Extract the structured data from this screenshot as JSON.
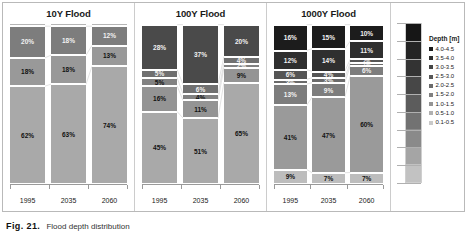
{
  "figure": {
    "caption_label": "Fig. 21.",
    "caption_text": "Flood depth distribution"
  },
  "legend": {
    "title": "Depth [m]",
    "items": [
      {
        "label": "4.0-4.5",
        "color": "#1a1a1a"
      },
      {
        "label": "3.5-4.0",
        "color": "#2e2e2e"
      },
      {
        "label": "3.0-3.5",
        "color": "#444444"
      },
      {
        "label": "2.5-3.0",
        "color": "#575757"
      },
      {
        "label": "2.0-2.5",
        "color": "#6b6b6b"
      },
      {
        "label": "1.5-2.0",
        "color": "#808080"
      },
      {
        "label": "1.0-1.5",
        "color": "#949494"
      },
      {
        "label": "0.5-1.0",
        "color": "#b0b0b0"
      },
      {
        "label": "0.1-0.5",
        "color": "#c9c9c9"
      }
    ],
    "gradient_stops": [
      "#161616",
      "#242424",
      "#333333",
      "#474747",
      "#5c5c5c",
      "#727272",
      "#8a8a8a",
      "#a5a5a5",
      "#c2c2c2"
    ]
  },
  "chart_data": [
    {
      "type": "bar",
      "title": "10Y Flood",
      "stacked": true,
      "xlabel": "",
      "ylabel": "",
      "ylim": [
        0,
        100
      ],
      "grid": false,
      "legend_position": "right-shared",
      "categories": [
        "1995",
        "2035",
        "2060"
      ],
      "series": [
        {
          "name": "4.0-4.5",
          "color": "#1a1a1a",
          "values": [
            0,
            0,
            0
          ]
        },
        {
          "name": "3.5-4.0",
          "color": "#2e2e2e",
          "values": [
            0,
            0,
            0
          ]
        },
        {
          "name": "3.0-3.5",
          "color": "#444444",
          "values": [
            0,
            0,
            0
          ]
        },
        {
          "name": "2.5-3.0",
          "color": "#575757",
          "values": [
            0,
            0,
            0
          ]
        },
        {
          "name": "2.0-2.5",
          "color": "#6b6b6b",
          "values": [
            0,
            0,
            0
          ]
        },
        {
          "name": "1.5-2.0",
          "color": "#808080",
          "values": [
            20,
            18,
            12
          ]
        },
        {
          "name": "1.0-1.5",
          "color": "#949494",
          "values": [
            18,
            18,
            13
          ]
        },
        {
          "name": "0.5-1.0",
          "color": "#b0b0b0",
          "values": [
            62,
            63,
            74
          ]
        },
        {
          "name": "0.1-0.5",
          "color": "#c9c9c9",
          "values": [
            0,
            1,
            1
          ]
        }
      ],
      "bars": [
        {
          "category": "1995",
          "segments": [
            {
              "label": "",
              "value": 2,
              "color": "#b5b5b5",
              "show_label": false
            },
            {
              "label": "20%",
              "value": 20,
              "color": "#7d7d7d",
              "show_label": true,
              "dark": true
            },
            {
              "label": "18%",
              "value": 18,
              "color": "#999999",
              "show_label": true,
              "dark": false
            },
            {
              "label": "62%",
              "value": 62,
              "color": "#a9a9a9",
              "show_label": true,
              "dark": false
            }
          ]
        },
        {
          "category": "2035",
          "segments": [
            {
              "label": "",
              "value": 2,
              "color": "#b5b5b5",
              "show_label": false
            },
            {
              "label": "18%",
              "value": 18,
              "color": "#7d7d7d",
              "show_label": true,
              "dark": true
            },
            {
              "label": "18%",
              "value": 18,
              "color": "#999999",
              "show_label": true,
              "dark": false
            },
            {
              "label": "63%",
              "value": 62,
              "color": "#a9a9a9",
              "show_label": true,
              "dark": false
            }
          ]
        },
        {
          "category": "2060",
          "segments": [
            {
              "label": "",
              "value": 2,
              "color": "#b5b5b5",
              "show_label": false
            },
            {
              "label": "12%",
              "value": 12,
              "color": "#7d7d7d",
              "show_label": true,
              "dark": true
            },
            {
              "label": "13%",
              "value": 13,
              "color": "#999999",
              "show_label": true,
              "dark": false
            },
            {
              "label": "74%",
              "value": 73,
              "color": "#a9a9a9",
              "show_label": true,
              "dark": false
            }
          ]
        }
      ]
    },
    {
      "type": "bar",
      "title": "100Y Flood",
      "stacked": true,
      "xlabel": "",
      "ylabel": "",
      "ylim": [
        0,
        100
      ],
      "grid": false,
      "legend_position": "right-shared",
      "categories": [
        "1995",
        "2035",
        "2060"
      ],
      "series": [
        {
          "name": "2.0-2.5",
          "color": "#4a4a4a",
          "values": [
            28,
            37,
            20
          ]
        },
        {
          "name": "1.5-2.0",
          "color": "#6e6e6e",
          "values": [
            5,
            6,
            4
          ]
        },
        {
          "name": "1.0-1.5",
          "color": "#808080",
          "values": [
            5,
            4,
            2
          ]
        },
        {
          "name": "0.5-1.0",
          "color": "#949494",
          "values": [
            16,
            11,
            9
          ]
        },
        {
          "name": "0.1-0.5",
          "color": "#a9a9a9",
          "values": [
            45,
            51,
            65
          ]
        }
      ],
      "bars": [
        {
          "category": "1995",
          "segments": [
            {
              "label": "",
              "value": 1,
              "color": "#3a3a3a",
              "show_label": false
            },
            {
              "label": "28%",
              "value": 28,
              "color": "#4a4a4a",
              "show_label": true,
              "dark": true
            },
            {
              "label": "5%",
              "value": 5,
              "color": "#707070",
              "show_label": true,
              "dark": true
            },
            {
              "label": "5%",
              "value": 5,
              "color": "#828282",
              "show_label": true,
              "dark": false
            },
            {
              "label": "16%",
              "value": 16,
              "color": "#949494",
              "show_label": true,
              "dark": false
            },
            {
              "label": "45%",
              "value": 45,
              "color": "#a9a9a9",
              "show_label": true,
              "dark": false
            }
          ]
        },
        {
          "category": "2035",
          "segments": [
            {
              "label": "",
              "value": 1,
              "color": "#3a3a3a",
              "show_label": false
            },
            {
              "label": "37%",
              "value": 37,
              "color": "#4a4a4a",
              "show_label": true,
              "dark": true
            },
            {
              "label": "6%",
              "value": 6,
              "color": "#707070",
              "show_label": true,
              "dark": true
            },
            {
              "label": "4%",
              "value": 4,
              "color": "#828282",
              "show_label": true,
              "dark": false
            },
            {
              "label": "11%",
              "value": 11,
              "color": "#949494",
              "show_label": true,
              "dark": false
            },
            {
              "label": "51%",
              "value": 41,
              "color": "#a9a9a9",
              "show_label": true,
              "dark": false
            }
          ]
        },
        {
          "category": "2060",
          "segments": [
            {
              "label": "",
              "value": 1,
              "color": "#3a3a3a",
              "show_label": false
            },
            {
              "label": "20%",
              "value": 20,
              "color": "#4a4a4a",
              "show_label": true,
              "dark": true
            },
            {
              "label": "4%",
              "value": 4,
              "color": "#707070",
              "show_label": true,
              "dark": true
            },
            {
              "label": "2%",
              "value": 3,
              "color": "#828282",
              "show_label": true,
              "dark": true
            },
            {
              "label": "9%",
              "value": 9,
              "color": "#949494",
              "show_label": true,
              "dark": false
            },
            {
              "label": "65%",
              "value": 63,
              "color": "#a9a9a9",
              "show_label": true,
              "dark": false
            }
          ]
        }
      ]
    },
    {
      "type": "bar",
      "title": "1000Y Flood",
      "stacked": true,
      "xlabel": "",
      "ylabel": "",
      "ylim": [
        0,
        100
      ],
      "grid": false,
      "legend_position": "right-shared",
      "categories": [
        "1995",
        "2035",
        "2060"
      ],
      "series": [
        {
          "name": "4.0-4.5",
          "color": "#1a1a1a",
          "values": [
            16,
            15,
            10
          ]
        },
        {
          "name": "3.5-4.0",
          "color": "#2e2e2e",
          "values": [
            12,
            14,
            11
          ]
        },
        {
          "name": "3.0-3.5",
          "color": "#555555",
          "values": [
            6,
            4,
            2
          ]
        },
        {
          "name": "2.5-3.0",
          "color": "#6b6b6b",
          "values": [
            3,
            3,
            1
          ]
        },
        {
          "name": "2.0-2.5",
          "color": "#7d7d7d",
          "values": [
            13,
            9,
            6
          ]
        },
        {
          "name": "1.5-2.0",
          "color": "#9a9a9a",
          "values": [
            41,
            47,
            60
          ]
        },
        {
          "name": "0.5-1.0",
          "color": "#bdbdbd",
          "values": [
            9,
            7,
            7
          ]
        }
      ],
      "bars": [
        {
          "category": "1995",
          "segments": [
            {
              "label": "",
              "value": 1,
              "color": "#0d0d0d",
              "show_label": false
            },
            {
              "label": "16%",
              "value": 16,
              "color": "#1c1c1c",
              "show_label": true,
              "dark": true
            },
            {
              "label": "12%",
              "value": 12,
              "color": "#2f2f2f",
              "show_label": true,
              "dark": true
            },
            {
              "label": "6%",
              "value": 6,
              "color": "#555555",
              "show_label": true,
              "dark": true
            },
            {
              "label": "3%",
              "value": 3,
              "color": "#6b6b6b",
              "show_label": true,
              "dark": true
            },
            {
              "label": "13%",
              "value": 13,
              "color": "#7d7d7d",
              "show_label": true,
              "dark": true
            },
            {
              "label": "41%",
              "value": 40,
              "color": "#9a9a9a",
              "show_label": true,
              "dark": false
            },
            {
              "label": "9%",
              "value": 9,
              "color": "#bdbdbd",
              "show_label": true,
              "dark": false
            }
          ]
        },
        {
          "category": "2035",
          "segments": [
            {
              "label": "",
              "value": 1,
              "color": "#0d0d0d",
              "show_label": false
            },
            {
              "label": "15%",
              "value": 15,
              "color": "#1c1c1c",
              "show_label": true,
              "dark": true
            },
            {
              "label": "14%",
              "value": 14,
              "color": "#2f2f2f",
              "show_label": true,
              "dark": true
            },
            {
              "label": "4%",
              "value": 4,
              "color": "#555555",
              "show_label": true,
              "dark": true
            },
            {
              "label": "3%",
              "value": 3,
              "color": "#6b6b6b",
              "show_label": true,
              "dark": true
            },
            {
              "label": "9%",
              "value": 9,
              "color": "#7d7d7d",
              "show_label": true,
              "dark": true
            },
            {
              "label": "47%",
              "value": 47,
              "color": "#9a9a9a",
              "show_label": true,
              "dark": false
            },
            {
              "label": "7%",
              "value": 7,
              "color": "#bdbdbd",
              "show_label": true,
              "dark": false
            }
          ]
        },
        {
          "category": "2060",
          "segments": [
            {
              "label": "",
              "value": 1,
              "color": "#0d0d0d",
              "show_label": false
            },
            {
              "label": "10%",
              "value": 10,
              "color": "#1c1c1c",
              "show_label": true,
              "dark": true
            },
            {
              "label": "11%",
              "value": 11,
              "color": "#2f2f2f",
              "show_label": true,
              "dark": true
            },
            {
              "label": "2%",
              "value": 2,
              "color": "#555555",
              "show_label": true,
              "dark": true,
              "tiny": true
            },
            {
              "label": "1%",
              "value": 2,
              "color": "#6b6b6b",
              "show_label": true,
              "dark": true,
              "tiny": true
            },
            {
              "label": "6%",
              "value": 6,
              "color": "#7d7d7d",
              "show_label": true,
              "dark": true
            },
            {
              "label": "60%",
              "value": 59,
              "color": "#9a9a9a",
              "show_label": true,
              "dark": false
            },
            {
              "label": "7%",
              "value": 7,
              "color": "#bdbdbd",
              "show_label": true,
              "dark": false
            }
          ]
        }
      ]
    }
  ]
}
